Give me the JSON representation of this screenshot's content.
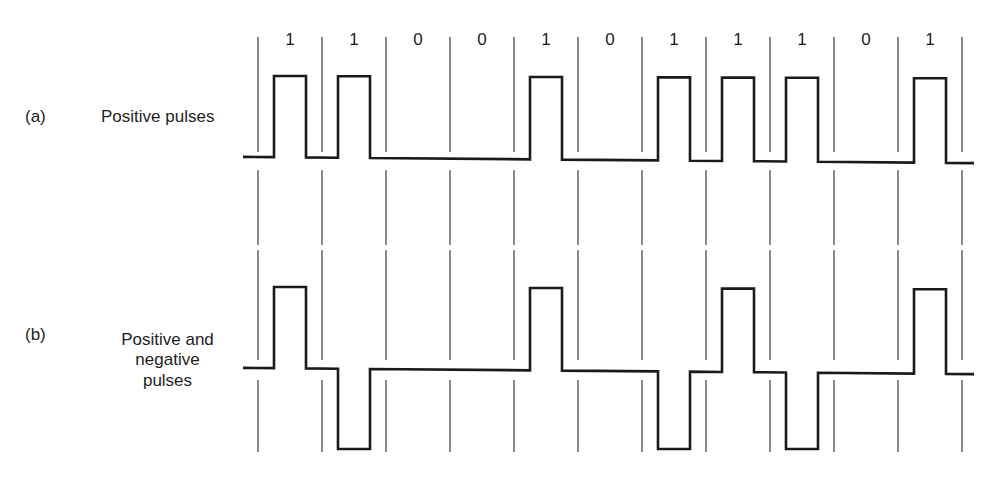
{
  "figure": {
    "panels": [
      {
        "id": "a",
        "tag": "(a)",
        "title_lines": [
          "Positive pulses"
        ],
        "encoding": "unipolar RZ"
      },
      {
        "id": "b",
        "tag": "(b)",
        "title_lines": [
          "Positive and",
          "negative",
          "pulses"
        ],
        "encoding": "bipolar RZ (AMI)"
      }
    ],
    "bits": [
      "1",
      "1",
      "0",
      "0",
      "1",
      "0",
      "1",
      "1",
      "1",
      "0",
      "1"
    ],
    "colors": {
      "background": "#ffffff",
      "waveform": "#1a1a1a",
      "gridline": "#2a2a2a",
      "text": "#1e1e1e"
    }
  },
  "chart_data": {
    "type": "line",
    "title": "",
    "xlabel": "bit slot",
    "ylabel": "pulse level",
    "categories": [
      "1",
      "1",
      "0",
      "0",
      "1",
      "0",
      "1",
      "1",
      "1",
      "0",
      "1"
    ],
    "series": [
      {
        "name": "(a) Positive pulses",
        "values": [
          1,
          1,
          0,
          0,
          1,
          0,
          1,
          1,
          1,
          0,
          1
        ]
      },
      {
        "name": "(b) Positive and negative pulses",
        "values": [
          1,
          -1,
          0,
          0,
          1,
          0,
          -1,
          1,
          -1,
          0,
          1
        ]
      }
    ],
    "ylim": [
      -1,
      1
    ],
    "grid": true
  }
}
